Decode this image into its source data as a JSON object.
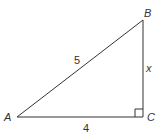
{
  "diagram": {
    "type": "right-triangle",
    "vertices": {
      "A": {
        "label": "A",
        "x": 17,
        "y": 117
      },
      "B": {
        "label": "B",
        "x": 143,
        "y": 20
      },
      "C": {
        "label": "C",
        "x": 143,
        "y": 117
      }
    },
    "sides": {
      "AB": {
        "label": "5"
      },
      "BC": {
        "label": "x"
      },
      "AC": {
        "label": "4"
      }
    },
    "right_angle_at": "C",
    "colors": {
      "line": "#333333",
      "background": "#ffffff"
    }
  }
}
